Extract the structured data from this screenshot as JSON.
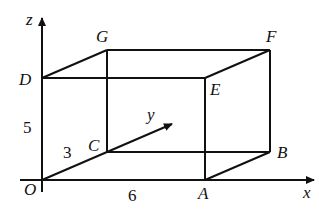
{
  "diagram": {
    "type": "3d-rectangular-box",
    "axes": {
      "x": "x",
      "y": "y",
      "z": "z"
    },
    "vertices": {
      "O": "O",
      "A": "A",
      "B": "B",
      "C": "C",
      "D": "D",
      "E": "E",
      "F": "F",
      "G": "G"
    },
    "dimensions": {
      "length_x": "6",
      "width_y": "3",
      "height_z": "5"
    },
    "stroke_color": "#111111",
    "background": "#ffffff"
  }
}
